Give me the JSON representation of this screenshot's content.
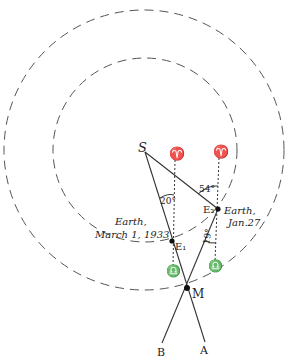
{
  "diagram": {
    "points": {
      "S": {
        "label": "S",
        "x": 145,
        "y": 152
      },
      "E1": {
        "label": "E₁",
        "x": 172,
        "y": 241
      },
      "E2": {
        "label": "E₂",
        "x": 218,
        "y": 209
      },
      "M": {
        "label": "M",
        "x": 187,
        "y": 288
      },
      "A": {
        "label": "A",
        "x": 205,
        "y": 350
      },
      "B": {
        "label": "B",
        "x": 162,
        "y": 352
      }
    },
    "labels": {
      "earth1_line1": "Earth,",
      "earth1_line2": "March 1, 1933",
      "earth2_line1": "Earth,",
      "earth2_line2": "Jan.27",
      "angle_20": "20°",
      "angle_54": "54°",
      "angle_19": "19°",
      "aries_symbol": "♈",
      "libra_symbol": "♎"
    },
    "orbits": [
      {
        "name": "outer-orbit",
        "cx": 144,
        "cy": 150,
        "r": 140
      },
      {
        "name": "inner-orbit",
        "cx": 145,
        "cy": 150,
        "r": 92
      }
    ],
    "colors": {
      "ink": "#222222",
      "dash": "#555555",
      "background": "#ffffff"
    }
  }
}
